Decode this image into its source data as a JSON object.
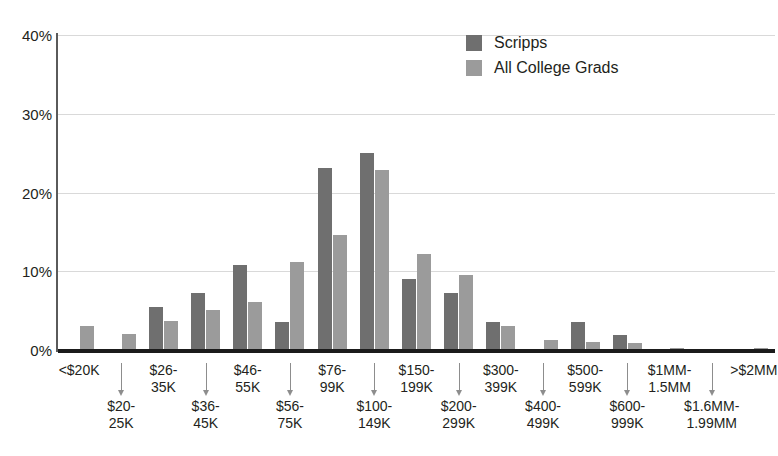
{
  "chart_data": {
    "type": "bar",
    "title": "",
    "xlabel": "",
    "ylabel": "",
    "ylim": [
      0,
      40
    ],
    "ytick_labels": [
      "0%",
      "10%",
      "20%",
      "30%",
      "40%"
    ],
    "ytick_values": [
      0,
      10,
      20,
      30,
      40
    ],
    "grid": true,
    "legend_position": "top-right",
    "categories": [
      "<$20K",
      "$20-25K",
      "$26-35K",
      "$36-45K",
      "$46-55K",
      "$56-75K",
      "$76-99K",
      "$100-149K",
      "$150-199K",
      "$200-299K",
      "$300-399K",
      "$400-499K",
      "$500-599K",
      "$600-999K",
      "$1MM-1.5MM",
      "$1.6MM-1.99MM",
      ">$2MM"
    ],
    "category_lines": [
      [
        "<$20K"
      ],
      [
        "$20-",
        "25K"
      ],
      [
        "$26-",
        "35K"
      ],
      [
        "$36-",
        "45K"
      ],
      [
        "$46-",
        "55K"
      ],
      [
        "$56-",
        "75K"
      ],
      [
        "$76-",
        "99K"
      ],
      [
        "$100-",
        "149K"
      ],
      [
        "$150-",
        "199K"
      ],
      [
        "$200-",
        "299K"
      ],
      [
        "$300-",
        "399K"
      ],
      [
        "$400-",
        "499K"
      ],
      [
        "$500-",
        "599K"
      ],
      [
        "$600-",
        "999K"
      ],
      [
        "$1MM-",
        "1.5MM"
      ],
      [
        "$1.6MM-",
        "1.99MM"
      ],
      [
        ">$2MM"
      ]
    ],
    "category_row": [
      "upper",
      "lower",
      "upper",
      "lower",
      "upper",
      "lower",
      "upper",
      "lower",
      "upper",
      "lower",
      "upper",
      "lower",
      "upper",
      "lower",
      "upper",
      "lower",
      "upper"
    ],
    "series": [
      {
        "name": "Scripps",
        "color": "#6f6f6f",
        "values": [
          0,
          0,
          5.4,
          7.2,
          10.8,
          3.6,
          23.1,
          25.0,
          9.0,
          7.2,
          3.5,
          0,
          3.6,
          1.9,
          0,
          0,
          0
        ]
      },
      {
        "name": "All College Grads",
        "color": "#9b9b9b",
        "values": [
          3.1,
          2.0,
          3.7,
          5.1,
          6.1,
          11.2,
          14.6,
          22.9,
          12.2,
          9.5,
          3.0,
          1.3,
          1.0,
          0.9,
          0.3,
          0.1,
          0.2
        ]
      }
    ]
  },
  "legend": {
    "items": [
      {
        "label": "Scripps",
        "swatch": "s1"
      },
      {
        "label": "All College Grads",
        "swatch": "s2"
      }
    ]
  },
  "colors": {
    "series_scripps": "#6f6f6f",
    "series_all_college_grads": "#9b9b9b",
    "gridline": "#d9d9d9",
    "axis": "#1b1b1b",
    "text": "#231f20"
  }
}
